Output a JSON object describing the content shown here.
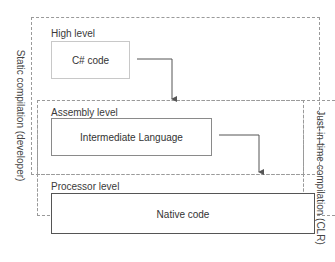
{
  "diagram": {
    "side_labels": {
      "left": "Static compilation (developer)",
      "right": "Just-in-time compilation (CLR)"
    },
    "levels": [
      {
        "label": "High level",
        "box": "C# code"
      },
      {
        "label": "Assembly level",
        "box": "Intermediate Language"
      },
      {
        "label": "Processor level",
        "box": "Native code"
      }
    ],
    "colors": {
      "dashed_border": "#9a9a9a",
      "high_box_border": "#c8c8c8",
      "assembly_box_border": "#8a8a8a",
      "native_box_border": "#555555",
      "arrow": "#555555"
    }
  }
}
